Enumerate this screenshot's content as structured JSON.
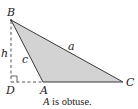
{
  "diagram": {
    "type": "triangle-with-altitude",
    "colors": {
      "fill": "#d3d3d3",
      "stroke": "#3a3a3a",
      "dashed": "#555555",
      "text": "#222222"
    },
    "vertices": {
      "B": {
        "label": "B",
        "x": 11,
        "y": 20
      },
      "A": {
        "label": "A",
        "x": 43,
        "y": 82
      },
      "C": {
        "label": "C",
        "x": 123,
        "y": 82
      },
      "D": {
        "label": "D",
        "x": 11,
        "y": 82
      }
    },
    "sides": {
      "a": {
        "label": "a"
      },
      "c": {
        "label": "c"
      },
      "h": {
        "label": "h"
      }
    },
    "caption_italic": "A",
    "caption_rest": " is obtuse."
  }
}
